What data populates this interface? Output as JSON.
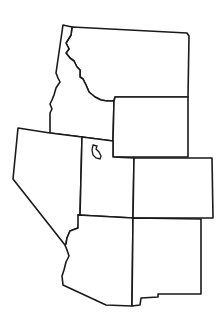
{
  "map": {
    "title": "",
    "region": "Mountain West United States",
    "line_color": "#1a1a1a",
    "fill_color": "#ffffff",
    "states": [
      {
        "id": "montana",
        "name": "Montana"
      },
      {
        "id": "idaho",
        "name": "Idaho"
      },
      {
        "id": "wyoming",
        "name": "Wyoming"
      },
      {
        "id": "nevada",
        "name": "Nevada"
      },
      {
        "id": "utah",
        "name": "Utah"
      },
      {
        "id": "colorado",
        "name": "Colorado"
      },
      {
        "id": "arizona",
        "name": "Arizona"
      },
      {
        "id": "new-mexico",
        "name": "New Mexico"
      }
    ],
    "features": [
      {
        "id": "great-salt-lake",
        "name": "Great Salt Lake"
      }
    ]
  }
}
